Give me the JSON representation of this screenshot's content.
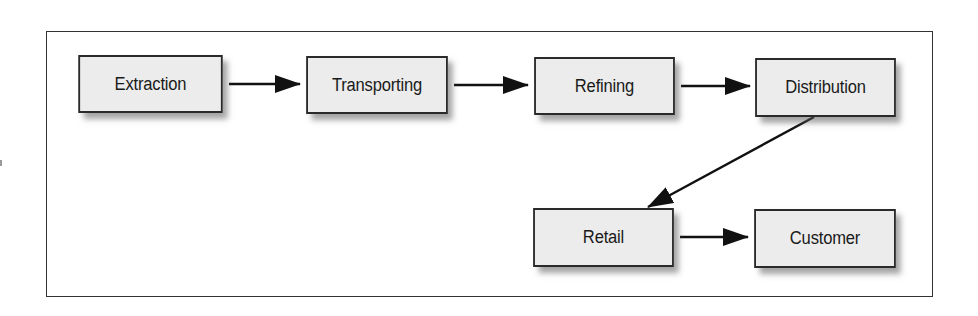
{
  "diagram": {
    "type": "flowchart",
    "nodes": [
      {
        "id": "extraction",
        "label": "Extraction"
      },
      {
        "id": "transporting",
        "label": "Transporting"
      },
      {
        "id": "refining",
        "label": "Refining"
      },
      {
        "id": "distribution",
        "label": "Distribution"
      },
      {
        "id": "retail",
        "label": "Retail"
      },
      {
        "id": "customer",
        "label": "Customer"
      }
    ],
    "edges": [
      {
        "from": "extraction",
        "to": "transporting"
      },
      {
        "from": "transporting",
        "to": "refining"
      },
      {
        "from": "refining",
        "to": "distribution"
      },
      {
        "from": "distribution",
        "to": "retail"
      },
      {
        "from": "retail",
        "to": "customer"
      }
    ],
    "colors": {
      "node_fill": "#ececec",
      "node_border": "#2a2a2a",
      "arrow": "#111111",
      "frame_border": "#333333"
    }
  }
}
